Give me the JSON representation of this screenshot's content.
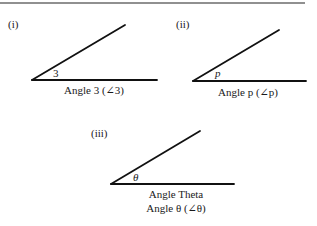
{
  "figure": {
    "panels": [
      {
        "id": "i",
        "label": "(i)",
        "angle_symbol": "3",
        "caption_lines": [
          "Angle 3 (∠3)"
        ]
      },
      {
        "id": "ii",
        "label": "(ii)",
        "angle_symbol": "p",
        "caption_lines": [
          "Angle p (∠p)"
        ]
      },
      {
        "id": "iii",
        "label": "(iii)",
        "angle_symbol": "θ",
        "caption_lines": [
          "Angle Theta",
          "Angle θ (∠θ)"
        ]
      }
    ],
    "colors": {
      "line": "#111111",
      "text": "#1a1a1a",
      "background": "#ffffff"
    }
  }
}
